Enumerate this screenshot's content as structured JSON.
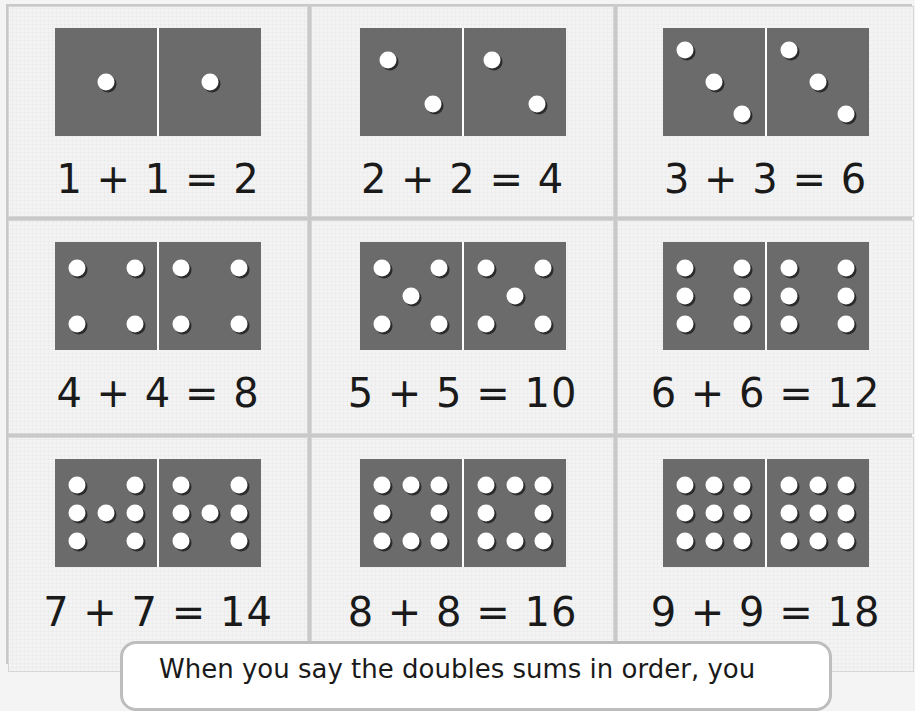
{
  "colors": {
    "domino": "#6b6b6b",
    "pip": "#ffffff",
    "paper": "#f3f3f3",
    "border": "#c9c9c9",
    "text": "#1a1a1a"
  },
  "cards": [
    {
      "n": 1,
      "equation": "1 + 1 = 2"
    },
    {
      "n": 2,
      "equation": "2 + 2 = 4"
    },
    {
      "n": 3,
      "equation": "3 + 3 = 6"
    },
    {
      "n": 4,
      "equation": "4 + 4 = 8"
    },
    {
      "n": 5,
      "equation": "5 + 5 = 10"
    },
    {
      "n": 6,
      "equation": "6 + 6 = 12"
    },
    {
      "n": 7,
      "equation": "7 + 7 = 14"
    },
    {
      "n": 8,
      "equation": "8 + 8 = 16"
    },
    {
      "n": 9,
      "equation": "9 + 9 = 18"
    }
  ],
  "callout": {
    "text": "When you say the doubles sums in order, you"
  }
}
